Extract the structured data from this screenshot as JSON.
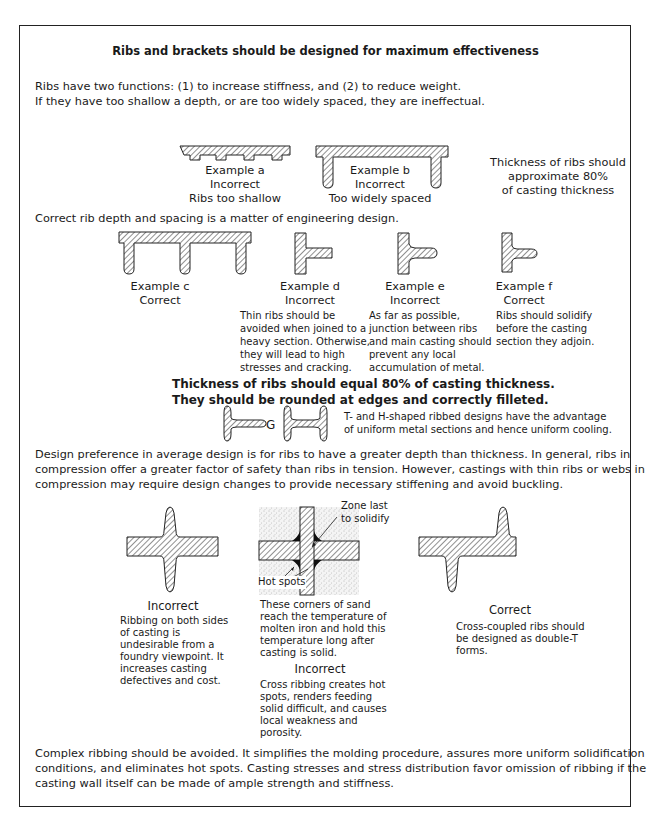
{
  "title": "Ribs and brackets should be designed for maximum effectiveness",
  "intro": {
    "line1": "Ribs have two functions: (1) to increase stiffness, and (2) to reduce weight.",
    "line2": "If they have too shallow a depth, or are too widely spaced, they are ineffectual."
  },
  "example_a": {
    "name": "Example a",
    "verdict": "Incorrect",
    "note": "Ribs too shallow"
  },
  "example_b": {
    "name": "Example b",
    "verdict": "Incorrect",
    "note": "Too widely spaced"
  },
  "thickness_note": {
    "line1": "Thickness of ribs should",
    "line2": "approximate 80%",
    "line3": "of casting thickness"
  },
  "rib_depth_text": "Correct rib depth and spacing is a matter of engineering design.",
  "example_c": {
    "name": "Example c",
    "verdict": "Correct"
  },
  "example_d": {
    "name": "Example d",
    "verdict": "Incorrect",
    "desc": [
      "Thin ribs should be",
      "avoided when joined to a",
      "heavy section. Otherwise,",
      "they will lead to high",
      "stresses and cracking."
    ]
  },
  "example_e": {
    "name": "Example e",
    "verdict": "Incorrect",
    "desc": [
      "As far as possible,",
      "junction between ribs",
      "and main casting should",
      "prevent any local",
      "accumulation of metal."
    ]
  },
  "example_f": {
    "name": "Example f",
    "verdict": "Correct",
    "desc": [
      "Ribs should solidify",
      "before the casting",
      "section they adjoin."
    ]
  },
  "bold_rule": {
    "line1": "Thickness of ribs should equal 80% of casting thickness.",
    "line2": "They should be rounded at edges and correctly filleted."
  },
  "example_g": {
    "label": "G",
    "desc": [
      "T- and H-shaped ribbed designs have the advantage",
      "of uniform metal sections and hence uniform cooling."
    ]
  },
  "design_pref": [
    "Design preference in average design is for ribs to have a greater depth than thickness. In general, ribs in",
    "compression offer a greater factor of safety than ribs in tension. However, castings with thin ribs or webs in",
    "compression may require design changes to provide necessary stiffening and avoid buckling."
  ],
  "cross_left": {
    "verdict": "Incorrect",
    "desc": [
      "Ribbing on both sides",
      "of casting is",
      "undesirable from a",
      "foundry viewpoint. It",
      "increases casting",
      "defectives and cost."
    ]
  },
  "cross_mid": {
    "zone_label": [
      "Zone last",
      "to solidify"
    ],
    "hot_spots_label": "Hot spots",
    "desc": [
      "These corners of sand",
      "reach the temperature of",
      "molten iron and hold this",
      "temperature long after",
      "casting is solid."
    ],
    "verdict": "Incorrect",
    "desc2": [
      "Cross ribbing creates hot",
      "spots, renders feeding",
      "solid difficult, and causes",
      "local weakness and",
      "porosity."
    ]
  },
  "cross_right": {
    "verdict": "Correct",
    "desc": [
      "Cross-coupled ribs should",
      "be designed as double-T",
      "forms."
    ]
  },
  "conclusion": [
    "Complex ribbing should be avoided. It simplifies the molding procedure, assures more uniform solidification",
    "conditions, and eliminates hot spots. Casting stresses and stress distribution favor omission of ribbing if the",
    "casting wall itself can be made of ample strength and stiffness."
  ]
}
